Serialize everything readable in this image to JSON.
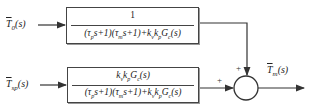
{
  "inputs": {
    "disturbance": {
      "label": "T̅0(s)",
      "display": "T̄0(s)"
    },
    "setpoint": {
      "label": "T̅sp(s)",
      "display": "T̄sp(s)"
    }
  },
  "output": {
    "label": "T̄m(s)"
  },
  "blocks": {
    "top": {
      "numerator": "1",
      "denominator": "(τps+1)(τms+1)+kvkpGc(s)"
    },
    "bottom": {
      "numerator": "kvkpGc(s)",
      "denominator": "(τps+1)(τms+1)+kvkpGc(s)"
    }
  },
  "summing_junction": {
    "top_sign": "+",
    "left_sign": "+"
  },
  "colors": {
    "line": "#333333",
    "box_border": "#444444"
  }
}
